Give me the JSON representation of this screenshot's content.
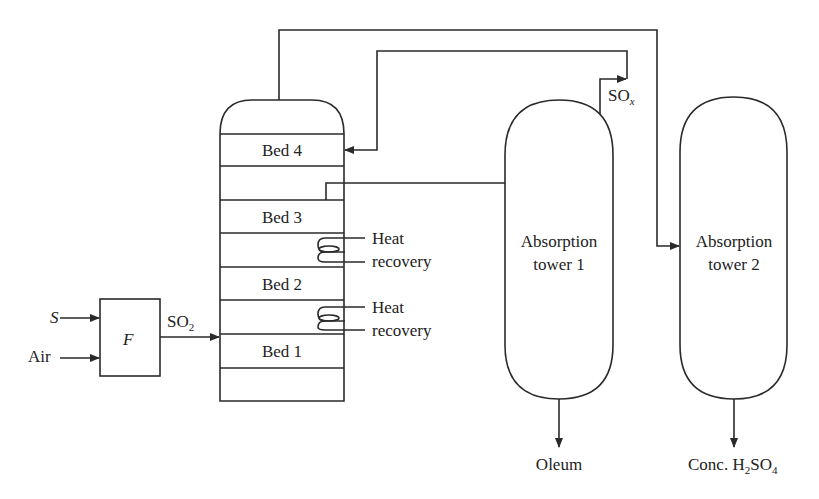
{
  "diagram": {
    "inputs": {
      "sulfur": "S",
      "air": "Air"
    },
    "furnace": {
      "label": "F"
    },
    "stream_so2": {
      "main": "SO",
      "sub": "2"
    },
    "stream_sox": {
      "main": "SO",
      "sub": "x"
    },
    "reactor": {
      "beds": [
        {
          "label": "Bed 4"
        },
        {
          "label": "Bed 3"
        },
        {
          "label": "Bed 2"
        },
        {
          "label": "Bed 1"
        }
      ]
    },
    "heat_recovery": [
      {
        "line1": "Heat",
        "line2": "recovery"
      },
      {
        "line1": "Heat",
        "line2": "recovery"
      }
    ],
    "towers": [
      {
        "line1": "Absorption",
        "line2": "tower 1",
        "output": "Oleum"
      },
      {
        "line1": "Absorption",
        "line2": "tower 2",
        "output_pre": "Conc. H",
        "output_sub1": "2",
        "output_mid": "SO",
        "output_sub2": "4"
      }
    ],
    "colors": {
      "line": "#2a2a2a",
      "text": "#222222",
      "background": "#ffffff"
    }
  }
}
